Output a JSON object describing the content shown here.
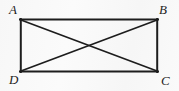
{
  "figure": {
    "kind": "geometry-diagram",
    "background_color": "#fafafa",
    "stroke_color": "#1d1d1d",
    "label_color": "#1d1d1d",
    "canvas": {
      "width": 179,
      "height": 91
    },
    "rectangle": {
      "left": 20,
      "top": 19,
      "right": 158,
      "bottom": 72,
      "stroke_width": 2
    },
    "diagonals": [
      {
        "name": "diagonal-A-C",
        "from": "A",
        "to": "C",
        "stroke_width": 1.7
      },
      {
        "name": "diagonal-B-D",
        "from": "B",
        "to": "D",
        "stroke_width": 1.7
      }
    ],
    "intersection": {
      "x": 89,
      "y": 45.5
    },
    "vertices": [
      {
        "id": "A",
        "label": "A",
        "corner": "top-left",
        "x": 20,
        "y": 19
      },
      {
        "id": "B",
        "label": "B",
        "corner": "top-right",
        "x": 158,
        "y": 19
      },
      {
        "id": "C",
        "label": "C",
        "corner": "bottom-right",
        "x": 158,
        "y": 72
      },
      {
        "id": "D",
        "label": "D",
        "corner": "bottom-left",
        "x": 20,
        "y": 72
      }
    ]
  }
}
